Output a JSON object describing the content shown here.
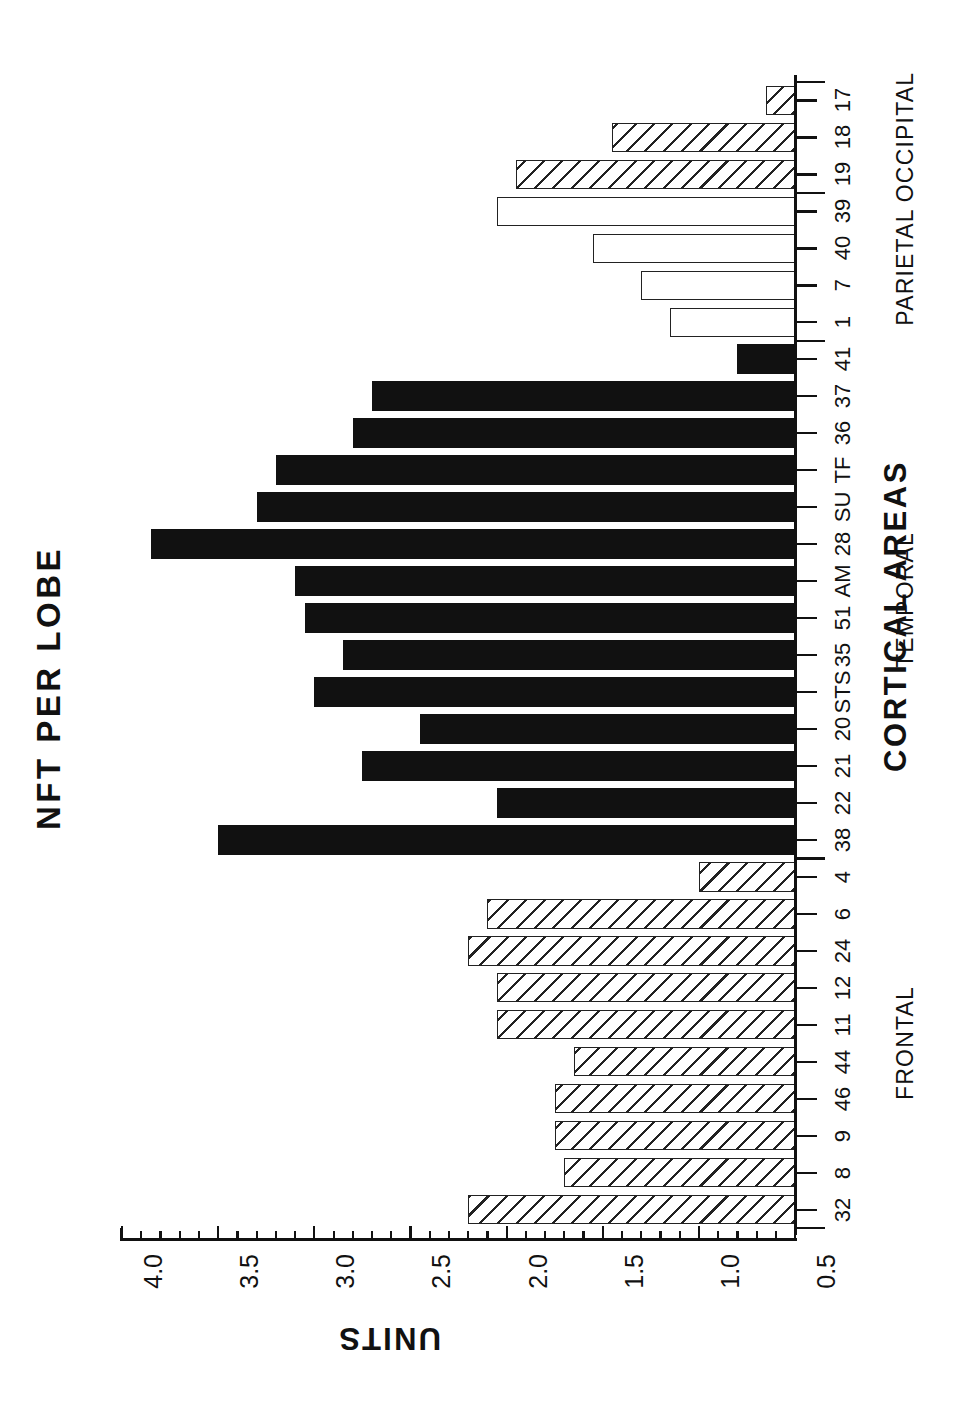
{
  "chart_data": {
    "type": "bar",
    "orientation": "horizontal",
    "title": "NFT PER LOBE",
    "xlabel": "CORTICAL AREAS",
    "ylabel": "UNITS",
    "value_axis": {
      "min": 0.5,
      "max": 4.0,
      "baseline": 0.5,
      "major_ticks": [
        4.0,
        3.5,
        3.0,
        2.5,
        2.0,
        1.5,
        1.0,
        0.5
      ],
      "major_tick_labels": [
        "4.0",
        "3.5",
        "3.0",
        "2.5",
        "2.0",
        "1.5",
        "1.0",
        "0.5"
      ],
      "minor_tick_step": 0.1,
      "grid": false
    },
    "groups": [
      {
        "name": "FRONTAL",
        "fill": "hatched",
        "categories": [
          "32",
          "8",
          "9",
          "46",
          "44",
          "11",
          "12",
          "24",
          "6",
          "4"
        ]
      },
      {
        "name": "TEMPORAL",
        "fill": "solid",
        "categories": [
          "38",
          "22",
          "21",
          "20",
          "STS",
          "35",
          "51",
          "AM",
          "28",
          "SU",
          "TF",
          "36",
          "37",
          "41"
        ]
      },
      {
        "name": "PARIETAL",
        "fill": "open",
        "categories": [
          "1",
          "7",
          "40",
          "39"
        ]
      },
      {
        "name": "OCCIPITAL",
        "fill": "hatched",
        "categories": [
          "19",
          "18",
          "17"
        ]
      }
    ],
    "categories": [
      "32",
      "8",
      "9",
      "46",
      "44",
      "11",
      "12",
      "24",
      "6",
      "4",
      "38",
      "22",
      "21",
      "20",
      "STS",
      "35",
      "51",
      "AM",
      "28",
      "SU",
      "TF",
      "36",
      "37",
      "41",
      "1",
      "7",
      "40",
      "39",
      "19",
      "18",
      "17"
    ],
    "values": [
      2.2,
      1.7,
      1.75,
      1.75,
      1.65,
      2.05,
      2.05,
      2.2,
      2.1,
      1.0,
      3.5,
      2.05,
      2.75,
      2.45,
      3.0,
      2.85,
      3.05,
      3.1,
      3.85,
      3.3,
      3.2,
      2.8,
      2.7,
      0.8,
      1.15,
      1.3,
      1.55,
      2.05,
      1.95,
      1.45,
      0.65
    ],
    "fills": [
      "hatched",
      "hatched",
      "hatched",
      "hatched",
      "hatched",
      "hatched",
      "hatched",
      "hatched",
      "hatched",
      "hatched",
      "solid",
      "solid",
      "solid",
      "solid",
      "solid",
      "solid",
      "solid",
      "solid",
      "solid",
      "solid",
      "solid",
      "solid",
      "solid",
      "solid",
      "open",
      "open",
      "open",
      "open",
      "hatched",
      "hatched",
      "hatched"
    ],
    "legend_position": "none",
    "colors": {
      "solid": "#111111",
      "outline": "#222222",
      "background": "#ffffff"
    }
  }
}
